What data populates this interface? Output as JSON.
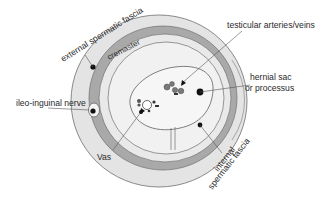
{
  "diagram": {
    "type": "anatomical cross-section",
    "labels": {
      "external_spermatic_fascia": "external spermatic fascia",
      "cremaster": "cremaster",
      "testicular_vessels": "testicular arteries/veins",
      "hernial_sac_line1": "hernial sac",
      "hernial_sac_line2": "or processus",
      "ilioinguinal_nerve": "ileo-inguinal nerve",
      "vas": "Vas",
      "internal_fascia_line1": "internal",
      "internal_fascia_line2": "spermatic fascia"
    },
    "colors": {
      "outer_band": "#e4e4e4",
      "cremaster_band": "#a9a9a9",
      "inner_band": "#e9e9e9",
      "inner_area": "#f1f1f1",
      "sac_fill": "#f6f6f6",
      "outline": "#6f6f6f",
      "leader_line": "#555555",
      "marker": "#111111",
      "vessel": "#7a7a7a"
    }
  }
}
